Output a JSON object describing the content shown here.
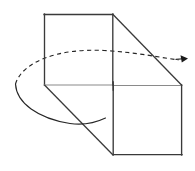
{
  "figure": {
    "background_color": "#ffffff",
    "canvas": {
      "width": 195,
      "height": 171
    },
    "stroke_colors": {
      "edge_dark": "#3a3a3a",
      "edge_light": "#8a8a8a",
      "arc": "#262626",
      "arrow": "#1a1a1a"
    },
    "labels": [],
    "annotations": [],
    "shapes": {
      "upper_face": {
        "name": "upper-left-square-face",
        "points": "44,14 113,14 113,85 44,85"
      },
      "lower_face": {
        "name": "lower-right-square-face",
        "points": "113,85 182,85 182,155 113,155"
      },
      "depth_edge_top": {
        "name": "top-depth-diagonal",
        "x1": 113,
        "y1": 14,
        "x2": 182,
        "y2": 85
      },
      "depth_edge_bottom": {
        "name": "bottom-depth-diagonal",
        "x1": 44,
        "y1": 85,
        "x2": 113,
        "y2": 155
      },
      "rotation_ellipse": {
        "name": "rotation-path-ellipse",
        "cx": 100,
        "cy": 88,
        "rx": 86,
        "ry": 31,
        "rotation_deg": -9,
        "front_arc_style": "solid",
        "back_arc_style": "dashed"
      },
      "arrow_tip": {
        "x": 188,
        "y": 59
      }
    }
  }
}
